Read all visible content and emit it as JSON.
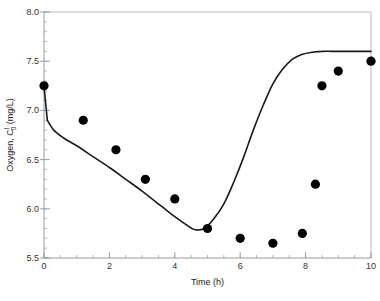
{
  "chart_data": {
    "type": "scatter",
    "title": "",
    "xlabel": "Time (h)",
    "ylabel": "Oxygen, C",
    "ylabel_sup": "l",
    "ylabel_sub": "0",
    "ylabel_units": " (mg/L)",
    "xlim": [
      0,
      10
    ],
    "ylim": [
      5.5,
      8.0
    ],
    "grid": false,
    "legend": null,
    "x_ticks": [
      0,
      2,
      4,
      6,
      8,
      10
    ],
    "x_tick_labels": [
      "0",
      "2",
      "4",
      "6",
      "8",
      "10"
    ],
    "y_ticks": [
      5.5,
      6.0,
      6.5,
      7.0,
      7.5,
      8.0
    ],
    "y_tick_labels": [
      "5.5",
      "6.0",
      "6.5",
      "7.0",
      "7.5",
      "8.0"
    ],
    "series": [
      {
        "name": "Measured",
        "type": "scatter",
        "marker": "filled-circle",
        "color": "#000000",
        "x": [
          0,
          1.2,
          2.2,
          3.1,
          4.0,
          5.0,
          6.0,
          7.0,
          7.9,
          8.3,
          8.5,
          9.0,
          10.0
        ],
        "y": [
          7.25,
          6.9,
          6.6,
          6.3,
          6.1,
          5.8,
          5.7,
          5.65,
          5.75,
          6.25,
          7.25,
          7.4,
          7.5
        ]
      },
      {
        "name": "Model",
        "type": "line",
        "color": "#1a1a1a",
        "x": [
          0,
          0.1,
          0.3,
          0.6,
          1.0,
          1.5,
          2.0,
          2.5,
          3.0,
          3.5,
          4.0,
          4.3,
          4.6,
          4.9,
          5.2,
          5.5,
          5.8,
          6.1,
          6.4,
          6.7,
          7.0,
          7.3,
          7.6,
          7.9,
          8.2,
          8.5,
          9.0,
          9.5,
          10.0
        ],
        "y": [
          7.25,
          6.9,
          6.8,
          6.72,
          6.64,
          6.53,
          6.42,
          6.3,
          6.18,
          6.05,
          5.92,
          5.85,
          5.79,
          5.8,
          5.9,
          6.05,
          6.27,
          6.52,
          6.8,
          7.05,
          7.27,
          7.42,
          7.52,
          7.57,
          7.59,
          7.6,
          7.6,
          7.6,
          7.6
        ]
      }
    ]
  },
  "colors": {
    "axis": "#999999",
    "plot_frame": "#bdbdbd",
    "marker": "#000000",
    "line": "#1a1a1a"
  }
}
